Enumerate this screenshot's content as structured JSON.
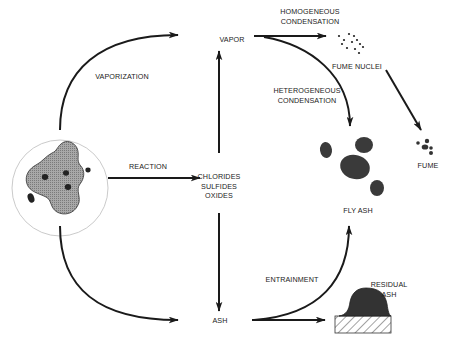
{
  "diagram": {
    "type": "process-flow",
    "colors": {
      "stroke": "#1a1a1a",
      "particle_fill": "#9a9a9a",
      "blob_fill": "#333333",
      "circle_outline": "#bdbdbd",
      "background": "#ffffff"
    },
    "nodes": {
      "particle": {
        "name": "burning particle (shaded char with inclusions)"
      },
      "vapor": {
        "label": "VAPOR"
      },
      "intermediates": {
        "lines": [
          "CHLORIDES",
          "SULFIDES",
          "OXIDES"
        ]
      },
      "ash": {
        "label": "ASH"
      },
      "fume_nuclei": {
        "label": "FUME NUCLEI"
      },
      "fume": {
        "label": "FUME"
      },
      "fly_ash": {
        "label": "FLY ASH"
      },
      "residual_ash": {
        "lines": [
          "RESIDUAL",
          "ASH"
        ]
      }
    },
    "edges": {
      "vaporization": {
        "label": "VAPORIZATION",
        "from": "particle",
        "to": "vapor"
      },
      "reaction": {
        "label": "REACTION",
        "from": "particle",
        "to": "intermediates"
      },
      "intermediates_to_vapor": {
        "from": "intermediates",
        "to": "vapor"
      },
      "intermediates_to_ash": {
        "from": "intermediates",
        "to": "ash"
      },
      "particle_to_ash": {
        "from": "particle",
        "to": "ash"
      },
      "homogeneous_condensation": {
        "lines": [
          "HOMOGENEOUS",
          "CONDENSATION"
        ],
        "from": "vapor",
        "to": "fume_nuclei"
      },
      "heterogeneous_condensation": {
        "lines": [
          "HETEROGENEOUS",
          "CONDENSATION"
        ],
        "from": "vapor",
        "to": "fly_ash"
      },
      "nuclei_to_fume": {
        "from": "fume_nuclei",
        "to": "fume"
      },
      "entrainment": {
        "label": "ENTRAINMENT",
        "from": "ash",
        "to": "fly_ash"
      },
      "ash_to_residual": {
        "from": "ash",
        "to": "residual_ash"
      }
    }
  }
}
